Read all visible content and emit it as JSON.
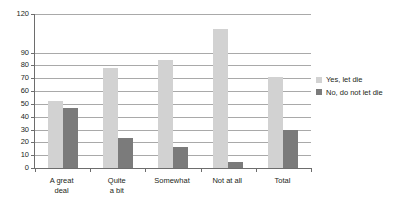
{
  "chart_data": {
    "type": "bar",
    "title": "",
    "subtitle": "",
    "xlabel": "",
    "ylabel": "",
    "ylim": [
      0,
      120
    ],
    "grid": true,
    "legend_position": "right",
    "categories": [
      "A great deal",
      "Quite a bit",
      "Somewhat",
      "Not at all",
      "Total"
    ],
    "category_lines": [
      [
        "A great",
        "deal"
      ],
      [
        "Quite",
        "a bit"
      ],
      [
        "Somewhat"
      ],
      [
        "Not at all"
      ],
      [
        "Total"
      ]
    ],
    "ytick_labels": [
      "120",
      "90",
      "80",
      "70",
      "60",
      "50",
      "40",
      "30",
      "20",
      "10",
      "0"
    ],
    "ytick_values": [
      120,
      90,
      80,
      70,
      60,
      50,
      40,
      30,
      20,
      10,
      0
    ],
    "series": [
      {
        "name": "Yes, let die",
        "color": "#d2d2d2",
        "values": [
          52,
          78,
          84,
          108,
          71
        ]
      },
      {
        "name": "No, do not let die",
        "color": "#7b7b7b",
        "values": [
          47,
          23,
          16,
          5,
          30
        ]
      }
    ]
  },
  "legend": {
    "items": [
      {
        "label": "Yes, let die"
      },
      {
        "label": "No, do not let die"
      }
    ]
  },
  "colors": {
    "series_light": "#d2d2d2",
    "series_dark": "#7b7b7b",
    "gridline": "#a9a9a9",
    "axis": "#6d6d6d",
    "text": "#231f20",
    "background": "#ffffff"
  }
}
